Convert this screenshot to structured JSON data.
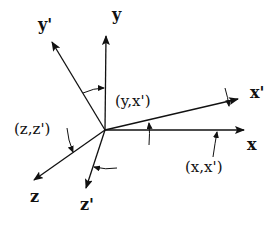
{
  "diagram": {
    "ink_color": "#111111",
    "origin": {
      "x": 105,
      "y": 130
    },
    "axes": [
      {
        "id": "y",
        "label": "y",
        "end": {
          "x": 106,
          "y": 36
        },
        "label_pos": {
          "x": 112,
          "y": 20
        }
      },
      {
        "id": "y_prime",
        "label": "y'",
        "end": {
          "x": 52,
          "y": 42
        },
        "label_pos": {
          "x": 38,
          "y": 30
        }
      },
      {
        "id": "x_prime",
        "label": "x'",
        "end": {
          "x": 238,
          "y": 99
        },
        "label_pos": {
          "x": 250,
          "y": 98
        }
      },
      {
        "id": "x",
        "label": "x",
        "end": {
          "x": 244,
          "y": 130
        },
        "label_pos": {
          "x": 247,
          "y": 150
        }
      },
      {
        "id": "z",
        "label": "z",
        "end": {
          "x": 34,
          "y": 180
        },
        "label_pos": {
          "x": 30,
          "y": 202
        }
      },
      {
        "id": "z_prime",
        "label": "z'",
        "end": {
          "x": 86,
          "y": 188
        },
        "label_pos": {
          "x": 80,
          "y": 210
        }
      }
    ],
    "angle_labels": [
      {
        "id": "yx_prime",
        "text": "(y,x')",
        "pos": {
          "x": 115,
          "y": 106
        }
      },
      {
        "id": "xx_prime",
        "text": "(x,x')",
        "pos": {
          "x": 185,
          "y": 166
        }
      },
      {
        "id": "zz_prime",
        "text": "(z,z')",
        "pos": {
          "x": 14,
          "y": 134
        }
      }
    ]
  }
}
